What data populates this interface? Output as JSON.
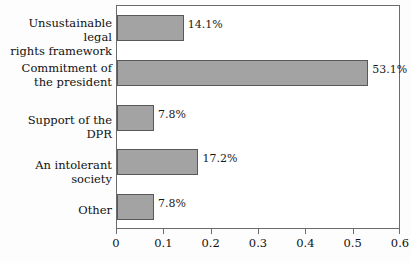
{
  "chart_data": {
    "type": "bar",
    "orientation": "horizontal",
    "title": "",
    "xlabel": "",
    "ylabel": "",
    "xlim": [
      0,
      0.6
    ],
    "xticks": [
      "0",
      "0.1",
      "0.2",
      "0.3",
      "0.4",
      "0.5",
      "0.6"
    ],
    "xtick_values": [
      0,
      0.1,
      0.2,
      0.3,
      0.4,
      0.5,
      0.6
    ],
    "grid": false,
    "legend": false,
    "bar_color": "#a3a3a3",
    "bar_edge_color": "#595959",
    "axis_color": "#6b6b6b",
    "categories": [
      "Unsustainable legal\nrights framework",
      "Commitment of\nthe president",
      "Support of the DPR",
      "An intolerant society",
      "Other"
    ],
    "values": [
      0.141,
      0.531,
      0.078,
      0.172,
      0.078
    ],
    "data_labels": [
      "14.1%",
      "53.1%",
      "7.8%",
      "17.2%",
      "7.8%"
    ]
  }
}
